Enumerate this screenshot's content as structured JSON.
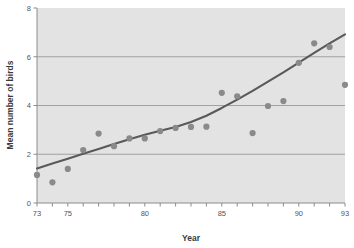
{
  "chart_data": {
    "type": "scatter",
    "title": "",
    "xlabel": "Year",
    "ylabel": "Mean number of birds",
    "xlim": [
      73,
      93
    ],
    "ylim": [
      0,
      8
    ],
    "xticks": [
      73,
      74,
      75,
      76,
      77,
      78,
      79,
      80,
      81,
      82,
      83,
      84,
      85,
      86,
      87,
      88,
      89,
      90,
      91,
      92,
      93
    ],
    "xtick_labels": [
      {
        "value": 73,
        "label": "73"
      },
      {
        "value": 75,
        "label": "75"
      },
      {
        "value": 80,
        "label": "80"
      },
      {
        "value": 85,
        "label": "85"
      },
      {
        "value": 90,
        "label": "90"
      },
      {
        "value": 93,
        "label": "93"
      }
    ],
    "yticks": [
      0,
      2,
      4,
      6,
      8
    ],
    "ytick_labels": [
      "0",
      "2",
      "4",
      "6",
      "8"
    ],
    "grid": "horizontal",
    "legend": "none",
    "plot_background": "#e3e3e3",
    "point_color": "#8a8a8a",
    "line_color": "#595959",
    "grid_color": "#9a9a9a",
    "x": [
      73,
      74,
      75,
      76,
      77,
      78,
      79,
      80,
      81,
      82,
      83,
      84,
      85,
      86,
      87,
      88,
      89,
      90,
      91,
      92,
      93
    ],
    "values": [
      1.15,
      0.85,
      1.4,
      2.17,
      2.85,
      2.33,
      2.65,
      2.65,
      2.95,
      3.08,
      3.12,
      3.13,
      4.52,
      4.38,
      2.87,
      3.98,
      4.18,
      5.75,
      6.55,
      6.4,
      4.85
    ],
    "points": [
      {
        "x": 73,
        "y": 1.15
      },
      {
        "x": 74,
        "y": 0.85
      },
      {
        "x": 75,
        "y": 1.4
      },
      {
        "x": 76,
        "y": 2.17
      },
      {
        "x": 77,
        "y": 2.85
      },
      {
        "x": 78,
        "y": 2.33
      },
      {
        "x": 79,
        "y": 2.65
      },
      {
        "x": 80,
        "y": 2.65
      },
      {
        "x": 81,
        "y": 2.95
      },
      {
        "x": 82,
        "y": 3.08
      },
      {
        "x": 83,
        "y": 3.12
      },
      {
        "x": 84,
        "y": 3.13
      },
      {
        "x": 85,
        "y": 4.52
      },
      {
        "x": 86,
        "y": 4.38
      },
      {
        "x": 87,
        "y": 2.87
      },
      {
        "x": 88,
        "y": 3.98
      },
      {
        "x": 89,
        "y": 4.18
      },
      {
        "x": 90,
        "y": 5.75
      },
      {
        "x": 91,
        "y": 6.55
      },
      {
        "x": 92,
        "y": 6.4
      },
      {
        "x": 93,
        "y": 4.85
      }
    ],
    "trend_line": {
      "name": "smoothed trend",
      "x": [
        73,
        74,
        75,
        76,
        77,
        78,
        79,
        80,
        81,
        82,
        83,
        84,
        85,
        86,
        87,
        88,
        89,
        90,
        91,
        92,
        93
      ],
      "y": [
        1.42,
        1.62,
        1.82,
        2.02,
        2.22,
        2.42,
        2.62,
        2.8,
        2.96,
        3.12,
        3.32,
        3.58,
        3.9,
        4.24,
        4.6,
        4.98,
        5.36,
        5.76,
        6.16,
        6.55,
        6.92
      ]
    }
  }
}
